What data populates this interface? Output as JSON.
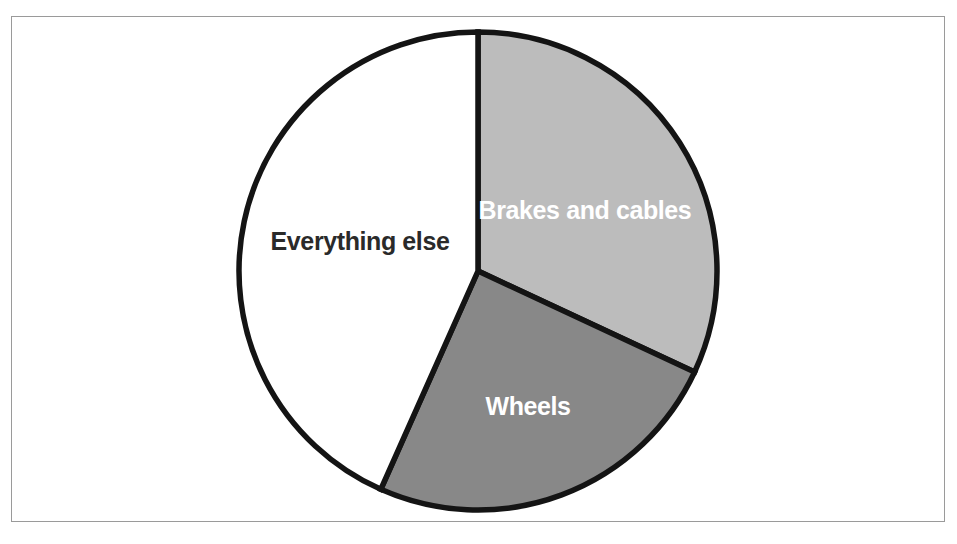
{
  "figure": {
    "background_color": "#ffffff",
    "frame_color": "#9a9a9a",
    "outline_color": "#141414"
  },
  "chart_data": {
    "type": "pie",
    "title": "",
    "subtitle": "",
    "xlabel": "",
    "ylabel": "",
    "legend_position": "none",
    "grid": false,
    "labels_inside_slices": true,
    "start_angle_deg": 0,
    "direction": "clockwise",
    "center": {
      "x": 478,
      "y": 271
    },
    "radius": 239,
    "categories": [
      "Brakes and cables",
      "Wheels",
      "Everything else"
    ],
    "values": [
      32,
      25,
      43
    ],
    "value_unit": "percent",
    "slices": [
      {
        "label": "Brakes and cables",
        "value": 32,
        "start_angle_deg": 0,
        "end_angle_deg": 115,
        "fill": "#bcbcbc",
        "label_fill": "#ffffff",
        "label_x": 585,
        "label_y": 212
      },
      {
        "label": "Wheels",
        "value": 25,
        "start_angle_deg": 115,
        "end_angle_deg": 204,
        "fill": "#888888",
        "label_fill": "#ffffff",
        "label_x": 528,
        "label_y": 408
      },
      {
        "label": "Everything else",
        "value": 43,
        "start_angle_deg": 204,
        "end_angle_deg": 360,
        "fill": "#ffffff",
        "label_fill": "#2a2a2a",
        "label_x": 360,
        "label_y": 243
      }
    ]
  }
}
